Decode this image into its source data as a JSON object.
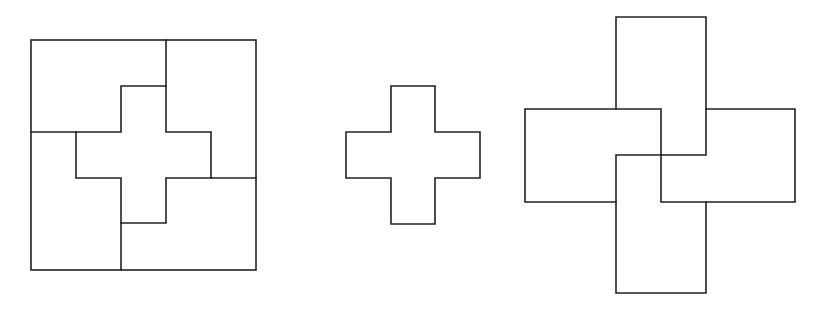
{
  "diagram": {
    "stroke_color": "#222222",
    "background": "#ffffff",
    "figures": [
      {
        "id": "square-dissection",
        "outer_square": {
          "x1": 31,
          "y1": 40,
          "x2": 256,
          "y2": 270
        },
        "cross": {
          "xs": [
            76,
            121,
            166,
            211
          ],
          "ys": [
            86,
            132,
            178,
            223
          ]
        },
        "cut_lines": [
          {
            "from": [
              166,
              40
            ],
            "to": [
              166,
              86
            ]
          },
          {
            "from": [
              31,
              132
            ],
            "to": [
              76,
              132
            ]
          },
          {
            "from": [
              121,
              223
            ],
            "to": [
              121,
              270
            ]
          },
          {
            "from": [
              211,
              178
            ],
            "to": [
              256,
              178
            ]
          }
        ]
      },
      {
        "id": "standalone-cross",
        "cross": {
          "xs": [
            346,
            391,
            435,
            480
          ],
          "ys": [
            86,
            132,
            178,
            224
          ]
        }
      },
      {
        "id": "pinwheel-rectangles",
        "rectangles": [
          {
            "name": "top",
            "x1": 616,
            "y1": 17,
            "x2": 706,
            "y2": 155
          },
          {
            "name": "left",
            "x1": 525,
            "y1": 109,
            "x2": 661,
            "y2": 202
          },
          {
            "name": "bottom",
            "x1": 616,
            "y1": 155,
            "x2": 706,
            "y2": 293
          },
          {
            "name": "right",
            "x1": 661,
            "y1": 109,
            "x2": 795,
            "y2": 202
          }
        ]
      }
    ]
  }
}
